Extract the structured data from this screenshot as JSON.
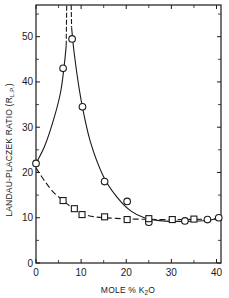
{
  "chart_data": {
    "type": "scatter",
    "title": "",
    "xlabel": "MOLE % K2O",
    "xlabel_parts": {
      "main": "MOLE % K",
      "sub": "2",
      "tail": "O"
    },
    "ylabel": "LANDAU-PLACZEK RATIO (R L.P.)",
    "ylabel_parts": {
      "main": "LANDAU-PLACZEK RATIO (R",
      "sub": "L.P.",
      "tail": ")"
    },
    "xlim": [
      0,
      41
    ],
    "ylim": [
      0,
      57
    ],
    "x_ticks": [
      0,
      10,
      20,
      30,
      40
    ],
    "x_minor_ticks": [
      5,
      15,
      25,
      35
    ],
    "y_ticks": [
      0,
      10,
      20,
      30,
      40,
      50
    ],
    "y_minor_ticks": [
      5,
      15,
      25,
      35,
      45,
      55
    ],
    "grid": false,
    "legend": null,
    "series": [
      {
        "name": "circles",
        "marker": "circle",
        "line": "solid",
        "points": [
          {
            "x": 0,
            "y": 22
          },
          {
            "x": 6,
            "y": 43
          },
          {
            "x": 8,
            "y": 49.5
          },
          {
            "x": 10.3,
            "y": 34.5
          },
          {
            "x": 15.2,
            "y": 18
          },
          {
            "x": 20.2,
            "y": 13.6
          },
          {
            "x": 25,
            "y": 9
          },
          {
            "x": 33,
            "y": 9.3
          },
          {
            "x": 38,
            "y": 9.6
          },
          {
            "x": 40.5,
            "y": 10
          }
        ],
        "curve_left": [
          [
            0,
            22
          ],
          [
            2,
            26
          ],
          [
            4,
            32
          ],
          [
            5.5,
            38
          ],
          [
            6.3,
            44
          ],
          [
            6.7,
            48
          ]
        ],
        "curve_left_dashed": [
          [
            6.7,
            48
          ],
          [
            6.8,
            57
          ]
        ],
        "curve_right_dashed": [
          [
            7.8,
            57
          ],
          [
            7.9,
            52
          ]
        ],
        "curve_right": [
          [
            7.9,
            52
          ],
          [
            8.5,
            46
          ],
          [
            10,
            36
          ],
          [
            12,
            27
          ],
          [
            15,
            19
          ],
          [
            18,
            14.5
          ],
          [
            21,
            11.5
          ],
          [
            24,
            10
          ],
          [
            28,
            9.3
          ],
          [
            33,
            9.2
          ],
          [
            38,
            9.4
          ],
          [
            40.5,
            10
          ]
        ]
      },
      {
        "name": "squares",
        "marker": "square",
        "line": "dashed",
        "points": [
          {
            "x": 6,
            "y": 13.8
          },
          {
            "x": 8.5,
            "y": 12
          },
          {
            "x": 10.2,
            "y": 10.7
          },
          {
            "x": 15.2,
            "y": 10.2
          },
          {
            "x": 20.2,
            "y": 9.6
          },
          {
            "x": 25,
            "y": 9.8
          },
          {
            "x": 30.2,
            "y": 9.6
          },
          {
            "x": 35,
            "y": 9.7
          }
        ],
        "curve": [
          [
            0,
            21
          ],
          [
            2,
            18
          ],
          [
            4,
            15.5
          ],
          [
            6,
            13.8
          ],
          [
            8,
            12.2
          ],
          [
            10,
            11
          ],
          [
            13,
            10.2
          ],
          [
            17,
            9.9
          ],
          [
            22,
            9.7
          ],
          [
            30,
            9.6
          ],
          [
            40.5,
            9.7
          ]
        ]
      }
    ]
  }
}
